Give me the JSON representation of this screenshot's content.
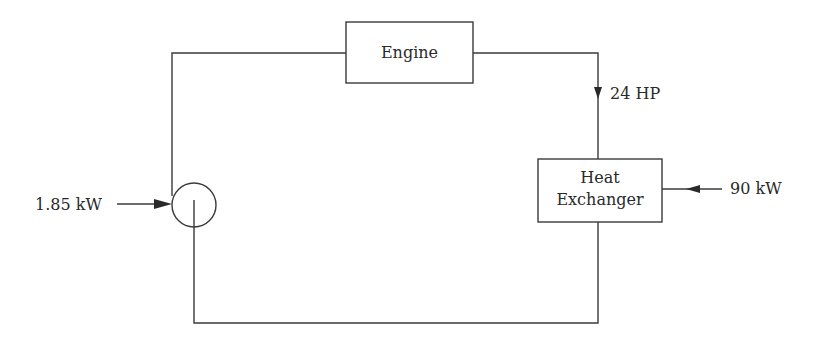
{
  "diagram": {
    "type": "energy-flow-loop",
    "components": {
      "engine": {
        "label": "Engine"
      },
      "heat_exchanger": {
        "label_line1": "Heat",
        "label_line2": "Exchanger"
      },
      "pump": {
        "label": ""
      }
    },
    "flows": {
      "engine_output": {
        "label": "24 HP",
        "direction": "down"
      },
      "heat_input": {
        "label": "90 kW",
        "direction": "left"
      },
      "pump_input": {
        "label": "1.85 kW",
        "direction": "right"
      }
    }
  }
}
